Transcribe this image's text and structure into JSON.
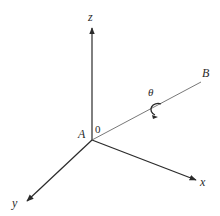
{
  "diagram": {
    "type": "3d-coordinate-axes",
    "origin": {
      "label": "A",
      "value_label": "0"
    },
    "axes": [
      {
        "name": "z",
        "label": "z",
        "direction": "up"
      },
      {
        "name": "x",
        "label": "x",
        "direction": "right-down"
      },
      {
        "name": "y",
        "label": "y",
        "direction": "left-down"
      }
    ],
    "line": {
      "from": "A",
      "to": "B",
      "end_label": "B"
    },
    "rotation": {
      "symbol": "θ",
      "about": "AB",
      "description": "rotation arrow about line AB"
    },
    "colors": {
      "stroke": "#2a2a2a",
      "background": "#ffffff"
    }
  }
}
